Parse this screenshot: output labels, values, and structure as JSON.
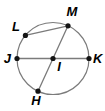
{
  "figure": {
    "type": "geometry-circle-diagram",
    "background": "#ffffff",
    "stroke_color": "#7b7b7b",
    "point_color": "#141414",
    "label_color": "#000000",
    "width": 105,
    "height": 111,
    "circle": {
      "cx": 53,
      "cy": 58.5,
      "r": 36
    },
    "points": [
      {
        "id": "L",
        "label": "L",
        "x": 25.4,
        "y": 35.4,
        "label_x": 16,
        "label_y": 31,
        "anchor": "middle"
      },
      {
        "id": "M",
        "label": "M",
        "x": 68,
        "y": 25.8,
        "label_x": 72,
        "label_y": 16,
        "anchor": "middle"
      },
      {
        "id": "J",
        "label": "J",
        "x": 17,
        "y": 58.5,
        "label_x": 11,
        "label_y": 63,
        "anchor": "end"
      },
      {
        "id": "I",
        "label": "I",
        "x": 53,
        "y": 58.5,
        "label_x": 59,
        "label_y": 71,
        "anchor": "middle"
      },
      {
        "id": "K",
        "label": "K",
        "x": 89,
        "y": 58.5,
        "label_x": 93,
        "label_y": 63,
        "anchor": "start"
      },
      {
        "id": "H",
        "label": "H",
        "x": 38,
        "y": 91.2,
        "label_x": 36,
        "label_y": 105,
        "anchor": "middle"
      }
    ],
    "segments": [
      {
        "name": "diameter-JK",
        "from": "J",
        "to": "K"
      },
      {
        "name": "diameter-MH",
        "from": "M",
        "to": "H"
      },
      {
        "name": "chord-LM",
        "from": "L",
        "to": "M"
      }
    ]
  }
}
